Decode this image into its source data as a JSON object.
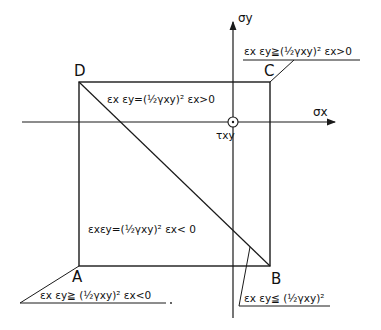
{
  "diagram": {
    "type": "strain-region diagram",
    "axes": {
      "horizontal": "σx",
      "vertical": "σy",
      "origin_symbol": "τxy"
    },
    "corners": {
      "A": "A",
      "B": "B",
      "C": "C",
      "D": "D"
    },
    "region_labels": {
      "upper_triangle": "εx εy=(½γxy)²  εx>0",
      "lower_triangle": "εxεy=(½γxy)²    εx< 0"
    },
    "corner_callouts": {
      "C": "εx εy≧(½γxy)²    εx>0",
      "A": "εx εy≧ (½γxy)²  εx<0",
      "B": "εx εy≦ (½γxy)²"
    },
    "colors": {
      "line": "#1a1a1a",
      "background": "#ffffff"
    }
  }
}
